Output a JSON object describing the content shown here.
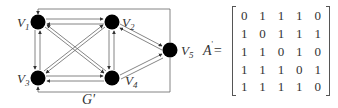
{
  "graph": {
    "label": "G'",
    "vertices": [
      {
        "id": "V1",
        "label": "V",
        "sub": "1",
        "x": 38,
        "y": 22
      },
      {
        "id": "V2",
        "label": "V",
        "sub": "2",
        "x": 112,
        "y": 22
      },
      {
        "id": "V3",
        "label": "V",
        "sub": "3",
        "x": 38,
        "y": 78
      },
      {
        "id": "V4",
        "label": "V",
        "sub": "4",
        "x": 112,
        "y": 78
      },
      {
        "id": "V5",
        "label": "V",
        "sub": "5",
        "x": 170,
        "y": 50
      }
    ],
    "colors": {
      "node": "#000000",
      "edge": "#555555"
    }
  },
  "matrix": {
    "name": "A",
    "superscript": "'",
    "equals": "=",
    "rows": [
      [
        "0",
        "1",
        "1",
        "1",
        "0"
      ],
      [
        "1",
        "0",
        "1",
        "1",
        "1"
      ],
      [
        "1",
        "1",
        "0",
        "1",
        "0"
      ],
      [
        "1",
        "1",
        "1",
        "0",
        "1"
      ],
      [
        "1",
        "1",
        "1",
        "1",
        "0"
      ]
    ]
  }
}
